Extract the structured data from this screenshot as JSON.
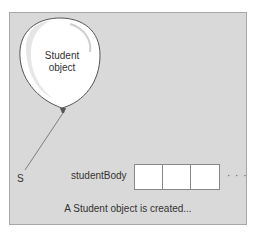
{
  "balloon": {
    "label_line1": "Student",
    "label_line2": "object"
  },
  "variables": {
    "s": "S",
    "student_body": "studentBody"
  },
  "array": {
    "cells": [
      "",
      "",
      ""
    ],
    "ellipsis": "· · ·"
  },
  "caption": "A Student object is created...",
  "colors": {
    "panel": "#d9d9d9",
    "balloon": "#ffffff",
    "string": "#666666"
  }
}
